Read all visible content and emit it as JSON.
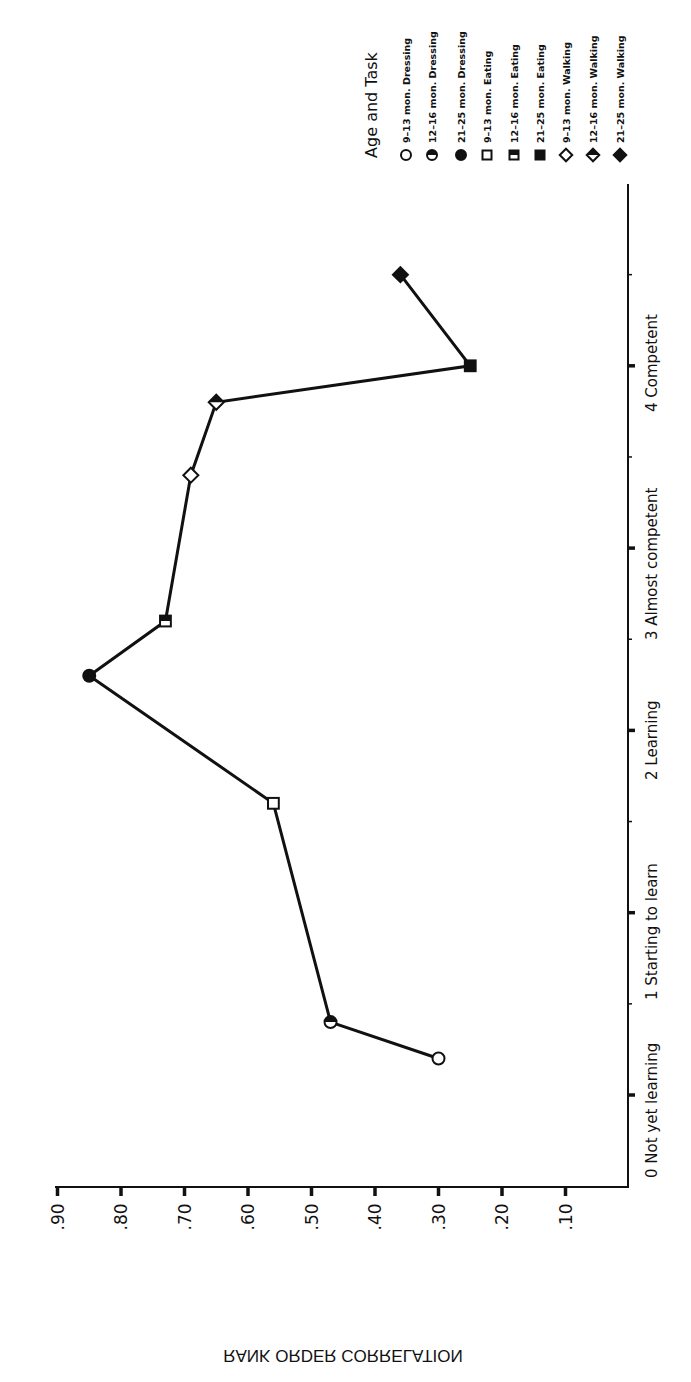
{
  "chart_data": {
    "type": "line",
    "orientation": "rotated-90-ccw",
    "title": "",
    "xlabel": "",
    "ylabel": "RANK ORDER CORRELATION",
    "x_range": [
      0,
      4.6
    ],
    "ylim": [
      0,
      0.9
    ],
    "x_ticks": [
      {
        "value": 0,
        "label": "0 Not yet learning"
      },
      {
        "value": 1,
        "label": "1 Starting to learn"
      },
      {
        "value": 2,
        "label": "2 Learning"
      },
      {
        "value": 3,
        "label": "3 Almost competent"
      },
      {
        "value": 4,
        "label": "4 Competent"
      }
    ],
    "y_ticks": [
      {
        "value": 0.9,
        "label": ".90"
      },
      {
        "value": 0.8,
        "label": ".80"
      },
      {
        "value": 0.7,
        "label": ".70"
      },
      {
        "value": 0.6,
        "label": ".60"
      },
      {
        "value": 0.5,
        "label": ".50"
      },
      {
        "value": 0.4,
        "label": ".40"
      },
      {
        "value": 0.3,
        "label": ".30"
      },
      {
        "value": 0.2,
        "label": ".20"
      },
      {
        "value": 0.1,
        "label": ".10"
      }
    ],
    "grid": false,
    "legend": {
      "title": "Age and Task",
      "placement": "top-right",
      "entries": [
        {
          "key": "d9",
          "label": "9–13 mon. Dressing",
          "marker": "circle",
          "fill": "open"
        },
        {
          "key": "d12",
          "label": "12–16 mon. Dressing",
          "marker": "circle",
          "fill": "half"
        },
        {
          "key": "d21",
          "label": "21–25 mon. Dressing",
          "marker": "circle",
          "fill": "full"
        },
        {
          "key": "e9",
          "label": "9–13 mon. Eating",
          "marker": "square",
          "fill": "open"
        },
        {
          "key": "e12",
          "label": "12–16 mon. Eating",
          "marker": "square",
          "fill": "half"
        },
        {
          "key": "e21",
          "label": "21–25 mon. Eating",
          "marker": "square",
          "fill": "full"
        },
        {
          "key": "w9",
          "label": "9–13 mon. Walking",
          "marker": "diamond",
          "fill": "open"
        },
        {
          "key": "w12",
          "label": "12–16 mon. Walking",
          "marker": "diamond",
          "fill": "half"
        },
        {
          "key": "w21",
          "label": "21–25 mon. Walking",
          "marker": "diamond",
          "fill": "full"
        }
      ]
    },
    "series": [
      {
        "name": "Age and Task",
        "points": [
          {
            "key": "d9",
            "x": 0.2,
            "y": 0.3
          },
          {
            "key": "d12",
            "x": 0.4,
            "y": 0.47
          },
          {
            "key": "e9",
            "x": 1.6,
            "y": 0.56
          },
          {
            "key": "d21",
            "x": 2.3,
            "y": 0.85
          },
          {
            "key": "e12",
            "x": 2.6,
            "y": 0.73
          },
          {
            "key": "w9",
            "x": 3.4,
            "y": 0.69
          },
          {
            "key": "w12",
            "x": 3.8,
            "y": 0.65
          },
          {
            "key": "e21",
            "x": 4.0,
            "y": 0.25
          },
          {
            "key": "w21",
            "x": 4.5,
            "y": 0.36
          }
        ]
      }
    ],
    "colors": {
      "ink": "#111111",
      "background": "#ffffff"
    }
  }
}
